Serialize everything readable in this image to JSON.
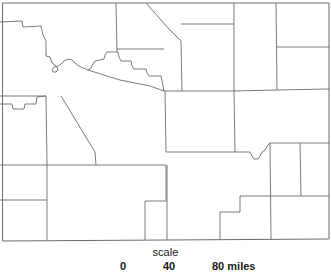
{
  "figure": {
    "kind": "county-outline-map",
    "region_shape": "rectangular state with county subdivisions",
    "background_color": "#ffffff",
    "line_color": "#6b6b6b",
    "text_color": "#1a1a1a"
  },
  "scale": {
    "caption": "scale",
    "unit_label": "miles",
    "ticks": [
      {
        "value": "0"
      },
      {
        "value": "40"
      },
      {
        "value": "80 miles"
      }
    ]
  },
  "map_geometry": {
    "outer_border": "M 2.5,3 L 329,3 L 329,239 L 2.5,241 Z",
    "interior_lines": [
      {
        "id": "nw-step-west",
        "d": "M 0,22 L 22,21 L 23,27 L 41,26 L 43,35 L 45,38"
      },
      {
        "id": "nw-diagonal-down",
        "d": "M 45,38 L 46,55 L 47,58"
      },
      {
        "id": "w-vert-upper",
        "d": "M 46,56 L 46,96"
      },
      {
        "id": "w-wavy-river",
        "d": "M 47,58 L 52,59 L 53,63 L 56,65 L 58,67 L 59,70 L 57,72 L 54,72 L 53,70 L 55,68 L 59,67 L 62,65 L 65,62 L 69,60 L 73,61 L 76,64 L 80,67 L 84,69 L 88,70"
      },
      {
        "id": "n-center-staircase",
        "d": "M 88,70 L 92,68 L 94,64 L 96,61 L 100,60 L 104,59 L 106,56 L 108,54 L 113,54 L 118,54 L 120,58 L 122,61 L 126,61 L 130,62 L 132,66 L 134,69 L 140,69 L 146,69 L 148,73 L 150,76 L 156,76 L 160,77 L 161,81 L 162,85 L 163,89 L 164,91"
      },
      {
        "id": "n-center-diagonal-long",
        "d": "M 88,70 L 120,80 L 150,86 L 164,91"
      },
      {
        "id": "nw-top-vert",
        "d": "M 116,3 L 117,53"
      },
      {
        "id": "n-mid-horiz",
        "d": "M 117,49 L 163,50"
      },
      {
        "id": "n-diag-to-ne",
        "d": "M 146,3 L 168,28 L 180,41"
      },
      {
        "id": "n-mid-vert-right",
        "d": "M 181,41 L 182,91"
      },
      {
        "id": "n-mid-horiz-right",
        "d": "M 181,24 L 234,24"
      },
      {
        "id": "ne-vert-a",
        "d": "M 234,3 L 234,91"
      },
      {
        "id": "ne-vert-b",
        "d": "M 276,3 L 277,90"
      },
      {
        "id": "ne-horiz-right",
        "d": "M 277,47 L 329,47"
      },
      {
        "id": "mid-horiz-main",
        "d": "M 164,91 L 182,91 L 234,91 L 277,90 L 329,89"
      },
      {
        "id": "w-step-left",
        "d": "M 0,104 L 12,104 L 13,109 L 24,109 L 25,104 L 36,104 L 37,97 L 46,96"
      },
      {
        "id": "w-vert-center",
        "d": "M 46,96 L 47,164"
      },
      {
        "id": "w-horiz-from-edge",
        "d": "M 0,96 L 46,96"
      },
      {
        "id": "c-vert-left",
        "d": "M 60,96 L 61,97"
      },
      {
        "id": "c-diag-left",
        "d": "M 61,97 L 95,152 L 96,165"
      },
      {
        "id": "c-left-small-vert",
        "d": "M 95,152 L 96,164"
      },
      {
        "id": "mid-vert-center",
        "d": "M 165,91 L 166,152"
      },
      {
        "id": "mid-horiz-lower",
        "d": "M 166,152 L 234,152 L 250,152"
      },
      {
        "id": "notch-right",
        "d": "M 250,152 L 252,156 L 254,159 L 258,159 L 260,156 L 262,152 L 265,150 L 268,145 L 270,143"
      },
      {
        "id": "right-vert-from-notch",
        "d": "M 270,143 L 271,239"
      },
      {
        "id": "right-horiz-upper",
        "d": "M 270,143 L 300,143 L 329,143"
      },
      {
        "id": "right-vert-far",
        "d": "M 300,143 L 301,196"
      },
      {
        "id": "right-horiz-lower",
        "d": "M 271,196 L 301,196 L 329,196"
      },
      {
        "id": "mid-vert-right-lower",
        "d": "M 234,91 L 235,152"
      },
      {
        "id": "sw-horiz-upper",
        "d": "M 0,165 L 47,165 L 96,165 L 166,165"
      },
      {
        "id": "sw-vert-left",
        "d": "M 47,165 L 47,239"
      },
      {
        "id": "sw-horiz-mid",
        "d": "M 0,200 L 47,200"
      },
      {
        "id": "s-vert-center-a",
        "d": "M 166,165 L 166,201"
      },
      {
        "id": "s-step-a",
        "d": "M 166,201 L 145,201 L 145,239"
      },
      {
        "id": "s-vert-center-b",
        "d": "M 166,165 L 167,210"
      },
      {
        "id": "s-step-b",
        "d": "M 220,239 L 220,212 L 240,212 L 240,196"
      },
      {
        "id": "s-horiz-toward-right",
        "d": "M 240,196 L 271,196"
      },
      {
        "id": "s-vert-tail",
        "d": "M 167,210 L 167,239"
      }
    ]
  }
}
